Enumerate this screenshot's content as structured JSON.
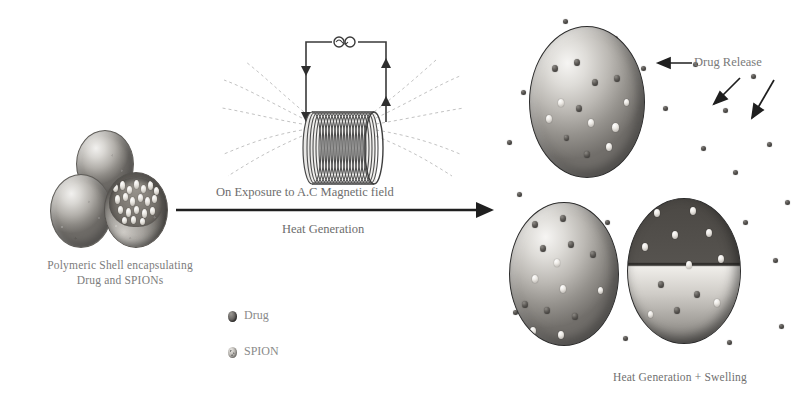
{
  "figure": {
    "type": "scientific-schematic",
    "theme": "grayscale",
    "background": "#ffffff",
    "ink_color": "#6d6d6d"
  },
  "left_panel": {
    "caption_line1": "Polymeric Shell encapsulating",
    "caption_line2": "Drug and SPIONs",
    "shells": [
      {
        "name": "shell-top",
        "state": "intact"
      },
      {
        "name": "shell-left",
        "state": "intact"
      },
      {
        "name": "shell-cutaway",
        "state": "cut-open-showing-payload"
      }
    ]
  },
  "center_panel": {
    "arrow_label_top": "On Exposure to A.C Magnetic field",
    "arrow_label_bottom": "Heat Generation",
    "coil": {
      "name": "solenoid-coil",
      "source_symbol": "ac-source",
      "turns": 26,
      "field_lines": "magnetic-flux-lines"
    }
  },
  "legend": {
    "items": [
      {
        "marker": "drug-marker",
        "label": "Drug"
      },
      {
        "marker": "spion-marker",
        "label": "SPION"
      }
    ]
  },
  "right_panel": {
    "annotation": "Drug Release",
    "caption": "Heat Generation + Swelling",
    "shells": [
      {
        "name": "swollen-shell-top",
        "state": "swollen"
      },
      {
        "name": "swollen-shell-bottom-left",
        "state": "swollen"
      },
      {
        "name": "swollen-shell-bottom-right",
        "state": "swollen-ruptured"
      }
    ]
  }
}
